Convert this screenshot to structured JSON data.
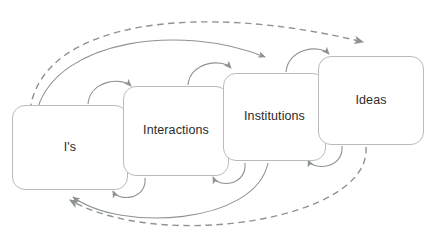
{
  "diagram": {
    "type": "flow-cycle",
    "background_color": "#ffffff",
    "node_fill": "#ffffff",
    "node_stroke": "#b9bcbe",
    "connector_solid_color": "#8e9295",
    "connector_dashed_color": "#8e9295",
    "label_color": "#2b2b2b",
    "nodes": [
      {
        "id": "is",
        "label": "I's"
      },
      {
        "id": "interactions",
        "label": "Interactions"
      },
      {
        "id": "institutions",
        "label": "Institutions"
      },
      {
        "id": "ideas",
        "label": "Ideas"
      }
    ],
    "connectors": [
      {
        "id": "is-to-interactions",
        "from": "is",
        "to": "interactions",
        "style": "solid",
        "direction": "forward",
        "shape": "short-arc-top"
      },
      {
        "id": "interactions-to-institutions",
        "from": "interactions",
        "to": "institutions",
        "style": "solid",
        "direction": "forward",
        "shape": "short-arc-top"
      },
      {
        "id": "institutions-to-ideas",
        "from": "institutions",
        "to": "ideas",
        "style": "solid",
        "direction": "forward",
        "shape": "short-arc-top"
      },
      {
        "id": "is-to-institutions",
        "from": "is",
        "to": "institutions",
        "style": "solid",
        "direction": "forward",
        "shape": "long-arc-top"
      },
      {
        "id": "is-to-ideas",
        "from": "is",
        "to": "ideas",
        "style": "dashed",
        "direction": "forward",
        "shape": "long-arc-top"
      },
      {
        "id": "interactions-to-is",
        "from": "interactions",
        "to": "is",
        "style": "solid",
        "direction": "return",
        "shape": "short-arc-bottom"
      },
      {
        "id": "institutions-to-interactions",
        "from": "institutions",
        "to": "interactions",
        "style": "solid",
        "direction": "return",
        "shape": "short-arc-bottom"
      },
      {
        "id": "ideas-to-institutions",
        "from": "ideas",
        "to": "institutions",
        "style": "solid",
        "direction": "return",
        "shape": "short-arc-bottom"
      },
      {
        "id": "institutions-to-is",
        "from": "institutions",
        "to": "is",
        "style": "solid",
        "direction": "return",
        "shape": "long-arc-bottom"
      },
      {
        "id": "ideas-to-is",
        "from": "ideas",
        "to": "is",
        "style": "dashed",
        "direction": "return",
        "shape": "long-arc-bottom"
      }
    ]
  }
}
